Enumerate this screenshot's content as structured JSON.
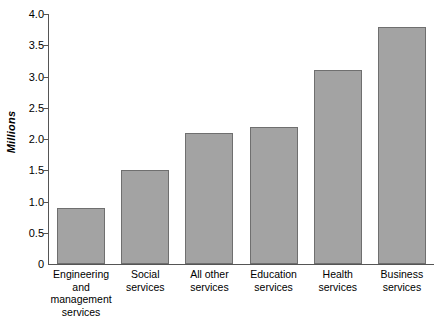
{
  "chart_data": {
    "type": "bar",
    "title": "",
    "subtitle": "",
    "xlabel": "",
    "ylabel": "Millions",
    "categories": [
      "Engineering and\nmanagement\nservices",
      "Social\nservices",
      "All other\nservices",
      "Education\nservices",
      "Health\nservices",
      "Business\nservices"
    ],
    "values": [
      0.9,
      1.5,
      2.1,
      2.2,
      3.1,
      3.8
    ],
    "ylim": [
      0,
      4.0
    ],
    "ytick_labels": [
      "0",
      "0.5",
      "1.0",
      "1.5",
      "2.0",
      "2.5",
      "3.0",
      "3.5",
      "4.0"
    ],
    "ytick_values": [
      0,
      0.5,
      1.0,
      1.5,
      2.0,
      2.5,
      3.0,
      3.5,
      4.0
    ],
    "grid": false,
    "legend": false,
    "legend_position": "none",
    "bar_color": "#a3a3a3",
    "bar_border_color": "#6f6f6f",
    "axis_color": "#555555",
    "text_color": "#000000",
    "background_color": "#ffffff"
  }
}
